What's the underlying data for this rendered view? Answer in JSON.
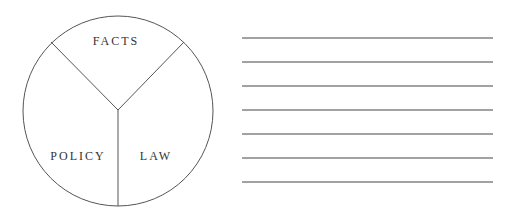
{
  "diagram": {
    "circle": {
      "cx": 118,
      "cy": 111,
      "r": 95,
      "stroke": "#555555"
    },
    "segments": [
      {
        "label": "FACTS"
      },
      {
        "label": "POLICY"
      },
      {
        "label": "LAW"
      }
    ]
  },
  "lines": {
    "count": 7,
    "x1": 242,
    "x2": 493,
    "ys": [
      38,
      62,
      86,
      110,
      134,
      158,
      182
    ],
    "stroke": "#444444"
  }
}
